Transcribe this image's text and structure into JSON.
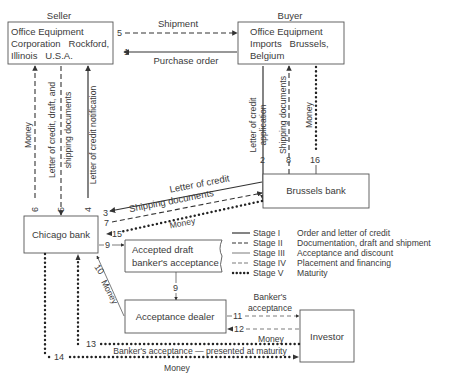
{
  "parties": {
    "seller": {
      "header": "Seller",
      "lines": [
        "Office Equipment",
        "Corporation   Rockford,",
        "Illinois   U.S.A."
      ]
    },
    "buyer": {
      "header": "Buyer",
      "lines": [
        "Office Equipment",
        "Imports   Brussels,",
        "Belgium"
      ]
    },
    "chicago_bank": {
      "label": "Chicago bank"
    },
    "brussels_bank": {
      "label": "Brussels bank"
    },
    "accepted_draft": {
      "lines": [
        "Accepted draft",
        "banker's acceptance"
      ]
    },
    "acceptance_dealer": {
      "label": "Acceptance dealer"
    },
    "investor": {
      "label": "Investor"
    }
  },
  "flows": {
    "f1": {
      "num": "1",
      "label": "Purchase order"
    },
    "f2": {
      "num": "2",
      "label_lines": [
        "Letter of credit",
        "application"
      ]
    },
    "f3a": {
      "num": "3",
      "label": "Letter of credit"
    },
    "f4": {
      "num": "4",
      "label": "Letter of credit notification"
    },
    "f5a": {
      "num": "5",
      "label": "Shipment"
    },
    "f5b": {
      "num": "5",
      "label_lines": [
        "Letter of credit, draft, and",
        "shipping documents"
      ]
    },
    "f6": {
      "num": "6",
      "label": "Money"
    },
    "f7": {
      "num": "7",
      "label": "Shipping documents"
    },
    "f8": {
      "num": "8",
      "label": "Shipping documents"
    },
    "f9a": {
      "num": "9"
    },
    "f9b": {
      "num": "9"
    },
    "f10": {
      "num": "10",
      "label": "Money"
    },
    "f11": {
      "num": "11",
      "label_lines": [
        "Banker's",
        "acceptance"
      ]
    },
    "f12": {
      "num": "12",
      "label": "Money"
    },
    "f13": {
      "num": "13",
      "label": "Banker's acceptance — presented at maturity"
    },
    "f14": {
      "num": "14",
      "label": "Money"
    },
    "f15": {
      "num": "15",
      "label": "Money"
    },
    "f16": {
      "num": "16",
      "label": "Money"
    }
  },
  "legend": {
    "items": [
      {
        "stage": "Stage I",
        "desc": "Order and letter of credit",
        "style": "solid"
      },
      {
        "stage": "Stage II",
        "desc": "Documentation, draft and shipment",
        "style": "dashed"
      },
      {
        "stage": "Stage III",
        "desc": "Acceptance and discount",
        "style": "thin-solid"
      },
      {
        "stage": "Stage IV",
        "desc": "Placement and financing",
        "style": "thin-dashed"
      },
      {
        "stage": "Stage V",
        "desc": "Maturity",
        "style": "dotted"
      }
    ]
  }
}
